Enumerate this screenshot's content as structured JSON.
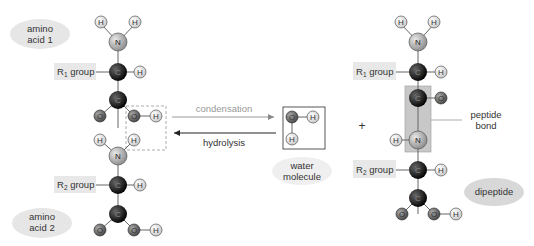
{
  "molecules": {
    "amino_acid_1": {
      "label_line1": "amino",
      "label_line2": "acid 1",
      "r_group": "R",
      "r_sub": "1",
      "r_suffix": " group"
    },
    "amino_acid_2": {
      "label_line1": "amino",
      "label_line2": "acid 2",
      "r_group": "R",
      "r_sub": "2",
      "r_suffix": " group"
    },
    "water": {
      "label_line1": "water",
      "label_line2": "molecule"
    },
    "dipeptide": {
      "label": "dipeptide",
      "r1_group": "R",
      "r1_sub": "1",
      "r2_group": "R",
      "r2_sub": "2",
      "r_suffix": " group"
    }
  },
  "reactions": {
    "forward": "condensation",
    "reverse": "hydrolysis",
    "plus": "+"
  },
  "annotations": {
    "peptide_bond_line1": "peptide",
    "peptide_bond_line2": "bond"
  },
  "atoms": {
    "H": "H",
    "N": "N",
    "C": "C",
    "O": "O"
  },
  "colors": {
    "hydrogen": "#e6e6e6",
    "nitrogen": "#b8b8b8",
    "carbon": "#111111",
    "oxygen": "#6a6a6a",
    "label_bg": "#e8e8e8",
    "peptide_box": "#c8c8c8"
  }
}
